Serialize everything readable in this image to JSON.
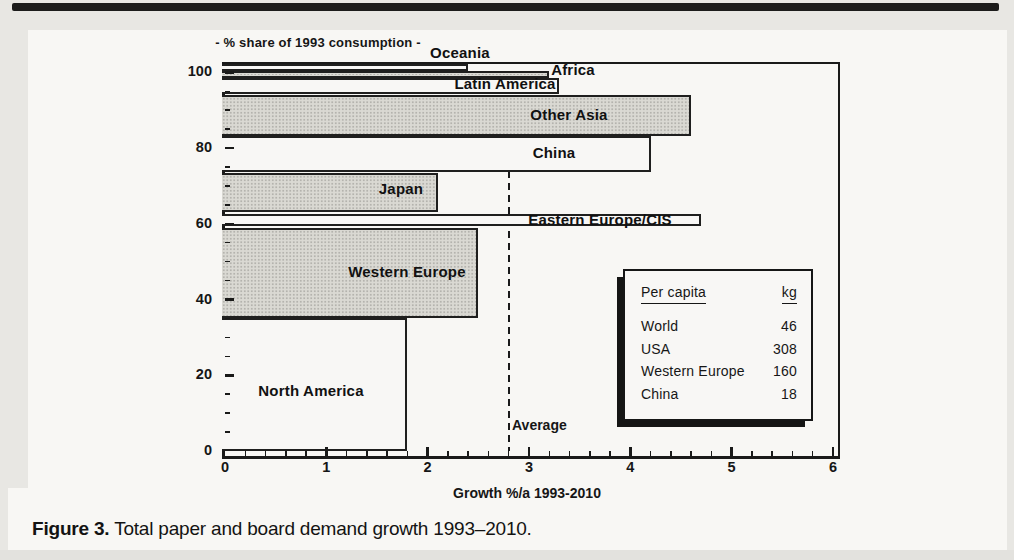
{
  "caption": {
    "label": "Figure 3.",
    "text": " Total paper and board demand growth 1993–2010."
  },
  "chart_data": {
    "type": "bar",
    "variant": "stacked-share-vs-growth (region shares stacked on y, growth rate on x)",
    "title": "- % share of 1993 consumption -",
    "xlabel": "Growth %/a 1993-2010",
    "ylabel": "% share of 1993 consumption",
    "xlim": [
      0,
      6
    ],
    "ylim": [
      0,
      100
    ],
    "x_ticks": [
      0,
      1,
      2,
      3,
      4,
      5,
      6
    ],
    "y_ticks": [
      0,
      20,
      40,
      60,
      80,
      100
    ],
    "x_minor_step": 0.2,
    "y_minor_step": 5,
    "grid": "off",
    "average": {
      "value": 2.8,
      "label": "Average"
    },
    "regions": [
      {
        "name": "North America",
        "growth": 1.8,
        "share_from": 0,
        "share_to": 35.2,
        "fill": "white"
      },
      {
        "name": "Western Europe",
        "growth": 2.5,
        "share_from": 35.2,
        "share_to": 59.0,
        "fill": "gray"
      },
      {
        "name": "Eastern Europe/CIS",
        "growth": 4.7,
        "share_from": 59.3,
        "share_to": 62.6,
        "fill": "white"
      },
      {
        "name": "Japan",
        "growth": 2.1,
        "share_from": 63.0,
        "share_to": 73.5,
        "fill": "gray"
      },
      {
        "name": "China",
        "growth": 4.2,
        "share_from": 73.6,
        "share_to": 83.2,
        "fill": "white"
      },
      {
        "name": "Other Asia",
        "growth": 4.6,
        "share_from": 83.2,
        "share_to": 94.0,
        "fill": "gray"
      },
      {
        "name": "Latin America",
        "growth": 3.3,
        "share_from": 94.4,
        "share_to": 98.4,
        "fill": "white"
      },
      {
        "name": "Africa",
        "growth": 3.2,
        "share_from": 98.4,
        "share_to": 100.4,
        "fill": "gray"
      },
      {
        "name": "Oceania",
        "growth": 2.4,
        "share_from": 100.4,
        "share_to": 102.2,
        "fill": "white"
      }
    ],
    "per_capita_table": {
      "header": [
        "Per capita",
        "kg"
      ],
      "rows": [
        [
          "World",
          "46"
        ],
        [
          "USA",
          "308"
        ],
        [
          "Western Europe",
          "160"
        ],
        [
          "China",
          "18"
        ]
      ]
    }
  },
  "colors": {
    "bar_gray": "#dad9d3",
    "bar_white": "#f8f7f5",
    "ink": "#1a1a19",
    "page_gray": "#e8e7e3",
    "panel_white": "#f8f7f4"
  }
}
